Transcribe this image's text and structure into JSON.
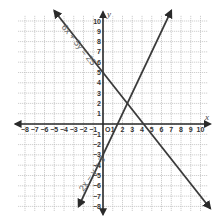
{
  "chart_data": {
    "type": "line",
    "title": "",
    "xlabel": "x",
    "ylabel": "y",
    "xlim": [
      -8.7,
      10.7
    ],
    "ylim": [
      -8.5,
      10.5
    ],
    "grid": true,
    "x_ticks": [
      -8,
      -7,
      -6,
      -5,
      -4,
      -3,
      -2,
      -1,
      1,
      2,
      3,
      4,
      5,
      6,
      7,
      8,
      9,
      10
    ],
    "y_ticks": [
      -8,
      -7,
      -6,
      -5,
      -4,
      -3,
      -2,
      -1,
      1,
      2,
      3,
      4,
      5,
      6,
      7,
      8,
      9,
      10
    ],
    "origin_label": "O",
    "series": [
      {
        "name": "6x + 5y = 25",
        "equation": "6x + 5y = 25",
        "slope": -1.2,
        "y_intercept": 5,
        "x_intercept": 4.1667,
        "points": [
          [
            -5,
            11
          ],
          [
            11,
            -8.2
          ]
        ]
      },
      {
        "name": "2x − y = 3",
        "equation": "2x − y = 3",
        "slope": 2,
        "y_intercept": -3,
        "x_intercept": 1.5,
        "points": [
          [
            -2.5,
            -8
          ],
          [
            7,
            11
          ]
        ]
      }
    ],
    "intersection": [
      2.5,
      2
    ],
    "colors": {
      "lines": "#3a3a3a",
      "axes": "#2a2a2a",
      "grid": "#b8b8b8"
    }
  },
  "labels": {
    "x_axis": "x",
    "y_axis": "y",
    "origin": "O",
    "eq1": "6x + 5y = 25",
    "eq2": "2x − y = 3"
  }
}
